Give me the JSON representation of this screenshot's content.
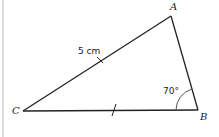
{
  "diagram": {
    "type": "triangle",
    "vertices": {
      "A": {
        "label": "A"
      },
      "B": {
        "label": "B"
      },
      "C": {
        "label": "C"
      }
    },
    "side_label": "5 cm",
    "angle_label": "70°",
    "equal_side_marks": [
      "CA",
      "CB"
    ],
    "colors": {
      "stroke": "#222222",
      "arc": "#555555",
      "left_rule": "#d0d0d0"
    }
  }
}
